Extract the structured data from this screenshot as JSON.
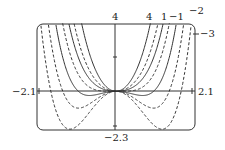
{
  "chart_data": {
    "type": "line",
    "title": "",
    "function": "f(x) = x^4 + c x^2",
    "xlabel": "",
    "ylabel": "",
    "xlim": [
      -2.1,
      2.1
    ],
    "ylim": [
      -2.3,
      4
    ],
    "grid": false,
    "x_tick_labels": [
      "-2.1",
      "2.1"
    ],
    "y_tick_labels": [
      "4",
      "-2.3"
    ],
    "series": [
      {
        "name": "4",
        "c": 4,
        "style": "solid"
      },
      {
        "name": "1",
        "c": 1,
        "style": "solid"
      },
      {
        "name": "-1",
        "c": -1,
        "style": "solid"
      },
      {
        "name": "-2",
        "c": -2,
        "style": "dashed"
      },
      {
        "name": "-3",
        "c": -3,
        "style": "dashed"
      }
    ],
    "extra_series": [
      {
        "name": "",
        "c": 2,
        "style": "dashed"
      },
      {
        "name": "",
        "c": 0,
        "style": "dashed"
      }
    ],
    "annotations": [
      "4",
      "1",
      "-1",
      "-2",
      "-3"
    ]
  },
  "labels": {
    "x_min": "−2.1",
    "x_max": "2.1",
    "y_max": "4",
    "y_min": "−2.3",
    "c4": "4",
    "c1": "1",
    "cm1": "−1",
    "cm2": "−2",
    "cm3": "−3"
  }
}
